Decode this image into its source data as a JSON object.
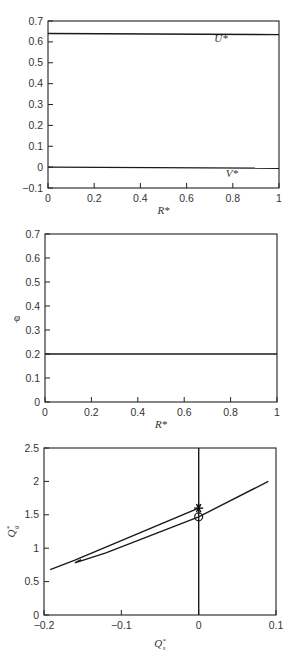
{
  "chart_data": [
    {
      "type": "line",
      "title": "",
      "xlabel": "R*",
      "ylabel": "",
      "xlim": [
        0,
        1
      ],
      "ylim": [
        -0.1,
        0.7
      ],
      "xticks": [
        0,
        0.2,
        0.4,
        0.6,
        0.8,
        1
      ],
      "xtick_labels": [
        "0",
        "0.2",
        "0.4",
        "0.6",
        "0.8",
        "1"
      ],
      "yticks": [
        -0.1,
        0,
        0.1,
        0.2,
        0.3,
        0.4,
        0.5,
        0.6,
        0.7
      ],
      "ytick_labels": [
        "−0.1",
        "0",
        "0.1",
        "0.2",
        "0.3",
        "0.4",
        "0.5",
        "0.6",
        "0.7"
      ],
      "grid": false,
      "series": [
        {
          "name": "U*",
          "x": [
            0,
            1
          ],
          "y": [
            0.64,
            0.635
          ]
        },
        {
          "name": "V*",
          "x": [
            0,
            1
          ],
          "y": [
            0.0,
            -0.005
          ]
        }
      ],
      "annotations": [
        {
          "text": "U*",
          "x": 0.72,
          "y": 0.6
        },
        {
          "text": "V*",
          "x": 0.77,
          "y": -0.045
        }
      ]
    },
    {
      "type": "line",
      "title": "",
      "xlabel": "R*",
      "ylabel": "φ",
      "xlim": [
        0,
        1
      ],
      "ylim": [
        0,
        0.7
      ],
      "xticks": [
        0,
        0.2,
        0.4,
        0.6,
        0.8,
        1
      ],
      "xtick_labels": [
        "0",
        "0.2",
        "0.4",
        "0.6",
        "0.8",
        "1"
      ],
      "yticks": [
        0,
        0.1,
        0.2,
        0.3,
        0.4,
        0.5,
        0.6,
        0.7
      ],
      "ytick_labels": [
        "0",
        "0.1",
        "0.2",
        "0.3",
        "0.4",
        "0.5",
        "0.6",
        "0.7"
      ],
      "grid": false,
      "series": [
        {
          "name": "phi",
          "x": [
            0,
            1
          ],
          "y": [
            0.2,
            0.2
          ]
        }
      ],
      "annotations": []
    },
    {
      "type": "line",
      "title": "",
      "xlabel": "Q*s",
      "ylabel": "Q*g",
      "xlim": [
        -0.2,
        0.1
      ],
      "ylim": [
        0,
        2.5
      ],
      "xticks": [
        -0.2,
        -0.1,
        0,
        0.1
      ],
      "xtick_labels": [
        "−0.2",
        "−0.1",
        "0",
        "0.1"
      ],
      "yticks": [
        0,
        0.5,
        1,
        1.5,
        2,
        2.5
      ],
      "ytick_labels": [
        "0",
        "0.5",
        "1",
        "1.5",
        "2",
        "2.5"
      ],
      "grid": false,
      "series": [
        {
          "name": "trajectory-upper",
          "x": [
            -0.192,
            -0.16,
            0.0
          ],
          "y": [
            0.68,
            0.82,
            1.6
          ]
        },
        {
          "name": "trajectory-lower",
          "x": [
            -0.152,
            -0.16,
            -0.12,
            0.0,
            0.09
          ],
          "y": [
            0.83,
            0.78,
            0.93,
            1.47,
            2.0
          ]
        },
        {
          "name": "vertical-line",
          "x": [
            0,
            0
          ],
          "y": [
            0,
            2.5
          ]
        }
      ],
      "markers": [
        {
          "name": "star",
          "symbol": "*",
          "x": 0,
          "y": 1.6
        },
        {
          "name": "circle",
          "symbol": "o",
          "x": 0,
          "y": 1.47
        }
      ],
      "annotations": []
    }
  ]
}
